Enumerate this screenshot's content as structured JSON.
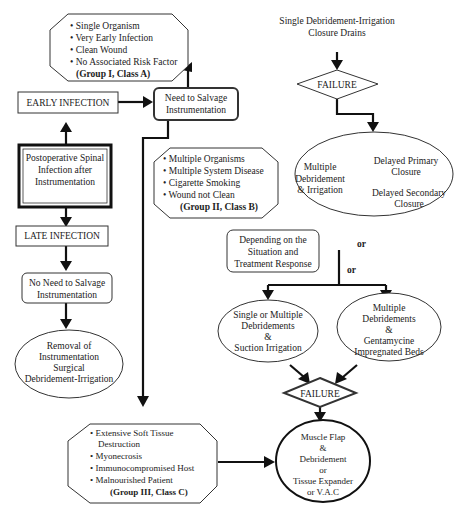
{
  "diagram": {
    "group_a": {
      "items": [
        "Single Organism",
        "Very Early Infection",
        "Clean Wound",
        "No Associated Risk Factor"
      ],
      "label": "(Group I, Class A)"
    },
    "early_infection": "EARLY INFECTION",
    "need_salvage": [
      "Need to Salvage",
      "Instrumentation"
    ],
    "postop": [
      "Postoperative Spinal",
      "Infection after",
      "Instrumentation"
    ],
    "late_infection": "LATE INFECTION",
    "no_need_salvage": [
      "No Need to Salvage",
      "Instrumentation"
    ],
    "removal": [
      "Removal of",
      "Instrumentation",
      "Surgical",
      "Debridement-Irrigation"
    ],
    "group_b": {
      "items": [
        "Multiple Organisms",
        "Multiple System Disease",
        "Cigarette Smoking",
        "Wound not Clean"
      ],
      "label": "(Group II, Class B)"
    },
    "single_debridement": [
      "Single Debridement-Irrigation",
      "Closure Drains"
    ],
    "failure_1": "FAILURE",
    "multiple_debridement": [
      "Multiple",
      "Debridement",
      "& Irrigation"
    ],
    "delayed_primary": [
      "Delayed Primary",
      "Closure"
    ],
    "delayed_secondary": [
      "Delayed Secondary",
      "Closure"
    ],
    "depending": [
      "Depending on the",
      "Situation and",
      "Treatment Response"
    ],
    "or_1": "or",
    "or_2": "or",
    "suction": [
      "Single or Multiple",
      "Debridements",
      "&",
      "Suction Irrigation"
    ],
    "gentamycine": [
      "Multiple",
      "Debridements",
      "&",
      "Gentamycine",
      "Impregnated Beds"
    ],
    "failure_2": "FAILURE",
    "group_c": {
      "items": [
        "Extensive Soft Tissue",
        "Destruction",
        "Myonecrosis",
        "Immunocompromised Host",
        "Malnourished Patient"
      ],
      "label": "(Group III, Class C)"
    },
    "muscle_flap": [
      "Muscle Flap",
      "&",
      "Debridement",
      "or",
      "Tissue Expander",
      "or V.A.C"
    ]
  }
}
